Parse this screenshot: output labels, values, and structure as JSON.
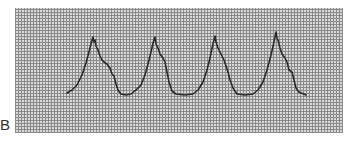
{
  "figure": {
    "panel_label": "B",
    "trace_color": "#2a2a2a",
    "grid_color": "#8a8a8a"
  },
  "chart_data": {
    "type": "line",
    "title": "",
    "xlabel": "",
    "ylabel": "",
    "grid": true,
    "beats": 4,
    "points_px": [
      [
        67,
        93
      ],
      [
        72,
        90
      ],
      [
        77,
        85
      ],
      [
        82,
        75
      ],
      [
        86,
        63
      ],
      [
        89,
        52
      ],
      [
        91,
        44
      ],
      [
        93,
        37
      ],
      [
        94,
        42
      ],
      [
        95,
        40
      ],
      [
        96,
        46
      ],
      [
        98,
        50
      ],
      [
        100,
        56
      ],
      [
        102,
        60
      ],
      [
        104,
        62
      ],
      [
        107,
        64
      ],
      [
        110,
        68
      ],
      [
        112,
        74
      ],
      [
        114,
        76
      ],
      [
        116,
        84
      ],
      [
        118,
        90
      ],
      [
        121,
        94
      ],
      [
        126,
        95
      ],
      [
        131,
        94
      ],
      [
        136,
        90
      ],
      [
        141,
        85
      ],
      [
        145,
        75
      ],
      [
        148,
        64
      ],
      [
        151,
        52
      ],
      [
        153,
        43
      ],
      [
        155,
        37
      ],
      [
        156,
        44
      ],
      [
        158,
        48
      ],
      [
        160,
        54
      ],
      [
        163,
        58
      ],
      [
        165,
        62
      ],
      [
        167,
        72
      ],
      [
        169,
        82
      ],
      [
        172,
        91
      ],
      [
        176,
        94
      ],
      [
        185,
        95
      ],
      [
        193,
        94
      ],
      [
        198,
        90
      ],
      [
        203,
        82
      ],
      [
        207,
        70
      ],
      [
        210,
        58
      ],
      [
        212,
        48
      ],
      [
        214,
        40
      ],
      [
        215,
        36
      ],
      [
        216,
        42
      ],
      [
        218,
        48
      ],
      [
        220,
        52
      ],
      [
        222,
        56
      ],
      [
        224,
        60
      ],
      [
        226,
        66
      ],
      [
        228,
        72
      ],
      [
        230,
        80
      ],
      [
        233,
        88
      ],
      [
        237,
        94
      ],
      [
        245,
        95
      ],
      [
        253,
        94
      ],
      [
        258,
        90
      ],
      [
        263,
        82
      ],
      [
        267,
        70
      ],
      [
        271,
        55
      ],
      [
        274,
        42
      ],
      [
        276,
        32
      ],
      [
        277,
        38
      ],
      [
        278,
        40
      ],
      [
        280,
        48
      ],
      [
        282,
        54
      ],
      [
        285,
        58
      ],
      [
        287,
        62
      ],
      [
        289,
        70
      ],
      [
        292,
        72
      ],
      [
        294,
        80
      ],
      [
        296,
        88
      ],
      [
        299,
        92
      ],
      [
        306,
        95
      ]
    ]
  }
}
